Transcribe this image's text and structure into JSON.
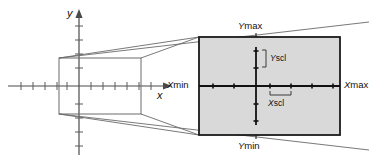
{
  "figure": {
    "background_color": "#ffffff",
    "line_color": "#3a3a3a",
    "bold_line_color": "#111111",
    "screen_fill_color": "#d9d9d9",
    "screen_border_color": "#1a1a1a"
  },
  "coordinate_plane": {
    "x_axis_label": "x",
    "y_axis_label": "y",
    "x_tick_count": 11,
    "y_tick_count": 8,
    "has_arrowheads": true
  },
  "labels": {
    "ymax": "Ymax",
    "ymin": "Ymin",
    "xmin": "Xmin",
    "xmax": "Xmax",
    "yscl": "Yscl",
    "xscl": "Xscl",
    "ymax_prefix": "Y",
    "ymax_suffix": "max",
    "ymin_prefix": "Y",
    "ymin_suffix": "min",
    "xmin_prefix": "X",
    "xmin_suffix": "min",
    "xmax_prefix": "X",
    "xmax_suffix": "max",
    "yscl_prefix": "Y",
    "yscl_suffix": "scl",
    "xscl_prefix": "X",
    "xscl_suffix": "scl"
  },
  "screen": {
    "x_tick_count": 6,
    "y_tick_count": 4,
    "description": "Shaded calculator screen showing the viewing rectangle"
  }
}
